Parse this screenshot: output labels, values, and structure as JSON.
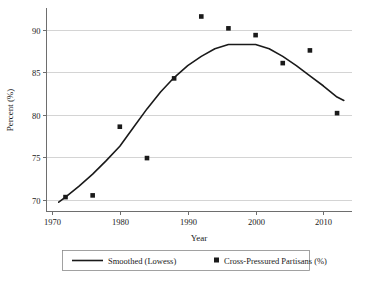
{
  "chart_data": {
    "type": "line",
    "title": "",
    "xlabel": "Year",
    "ylabel": "Percent (%)",
    "xlim": [
      1969.2,
      2014.2
    ],
    "ylim": [
      68.6,
      92.6
    ],
    "xticks": [
      1970,
      1980,
      1990,
      2000,
      2010
    ],
    "xticklabels": [
      "1970",
      "1980",
      "1990",
      "2000",
      "2010"
    ],
    "yticks": [
      70,
      75,
      80,
      85,
      90
    ],
    "yticklabels": [
      "70",
      "75",
      "80",
      "85",
      "90"
    ],
    "grid": "horizontal",
    "legend_position": "below-plot-center",
    "series": [
      {
        "name": "Smoothed (Lowess)",
        "type": "line",
        "color": "#1a1a1a",
        "x": [
          1971.0,
          1972.0,
          1974.0,
          1976.0,
          1978.0,
          1980.0,
          1982.0,
          1984.0,
          1986.0,
          1988.0,
          1990.0,
          1992.0,
          1994.0,
          1996.0,
          1998.0,
          2000.0,
          2002.0,
          2004.0,
          2006.0,
          2008.0,
          2010.0,
          2012.0,
          2013.0
        ],
        "values": [
          69.7,
          70.3,
          71.6,
          73.0,
          74.6,
          76.3,
          78.5,
          80.7,
          82.7,
          84.4,
          85.8,
          86.9,
          87.8,
          88.3,
          88.3,
          88.3,
          87.8,
          86.9,
          85.8,
          84.6,
          83.4,
          82.1,
          81.7
        ]
      },
      {
        "name": "Cross-Pressured Partisans (%)",
        "type": "scatter",
        "color": "#1a1a1a",
        "marker": "square",
        "x": [
          1972,
          1976,
          1980,
          1984,
          1988,
          1992,
          1996,
          2000,
          2004,
          2008,
          2012
        ],
        "values": [
          70.3,
          70.5,
          78.6,
          74.9,
          84.3,
          91.6,
          90.2,
          89.4,
          86.1,
          87.6,
          80.2
        ]
      }
    ]
  },
  "legend": {
    "items": [
      {
        "label": "Smoothed (Lowess)",
        "marker": "line"
      },
      {
        "label": "Cross-Pressured Partisans (%)",
        "marker": "square"
      }
    ]
  }
}
